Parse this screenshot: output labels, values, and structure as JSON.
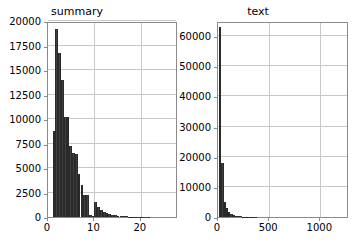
{
  "figure": {
    "background": "#ffffff",
    "bar_color": "#3f3f3f",
    "grid_color": "#c8c8c8",
    "axis_color": "#8a8a8a"
  },
  "chart_data": [
    {
      "type": "bar",
      "subplot": "left",
      "title": "summary",
      "xlabel": "",
      "ylabel": "",
      "xlim": [
        0,
        28
      ],
      "ylim": [
        0,
        20000
      ],
      "grid": true,
      "legend": null,
      "xticks": [
        0,
        10,
        20
      ],
      "xtick_labels": [
        "0",
        "10",
        "20"
      ],
      "yticks": [
        0,
        2500,
        5000,
        7500,
        10000,
        12500,
        15000,
        17500,
        20000
      ],
      "ytick_labels": [
        "0",
        "2500",
        "5000",
        "7500",
        "10000",
        "12500",
        "15000",
        "17500",
        "20000"
      ],
      "bin_edges": [
        1.0,
        1.6,
        2.2,
        2.8,
        3.4,
        4.0,
        4.6,
        5.2,
        5.8,
        6.4,
        7.0,
        7.6,
        8.2,
        8.8,
        9.4,
        10.0,
        10.6,
        11.2,
        11.8,
        12.4,
        13.0,
        13.6,
        14.2,
        14.8,
        15.4,
        16.0,
        16.6,
        17.2,
        17.8,
        18.4,
        19.0,
        20.0,
        22.0,
        24.0,
        26.0,
        28.0
      ],
      "values": [
        8800,
        19200,
        16700,
        14000,
        10200,
        10200,
        7200,
        6500,
        6400,
        4400,
        3300,
        2200,
        2200,
        250,
        150,
        1500,
        1050,
        700,
        500,
        380,
        300,
        230,
        180,
        140,
        110,
        80,
        60,
        45,
        30,
        20,
        12,
        8,
        4,
        2,
        1
      ]
    },
    {
      "type": "bar",
      "subplot": "right",
      "title": "text",
      "xlabel": "",
      "ylabel": "",
      "xlim": [
        0,
        1280
      ],
      "ylim": [
        0,
        65000
      ],
      "grid": true,
      "legend": null,
      "xticks": [
        0,
        500,
        1000
      ],
      "xtick_labels": [
        "0",
        "500",
        "1000"
      ],
      "yticks": [
        0,
        10000,
        20000,
        30000,
        40000,
        50000,
        60000
      ],
      "ytick_labels": [
        "0",
        "10000",
        "20000",
        "30000",
        "40000",
        "50000",
        "60000"
      ],
      "bin_edges": [
        10,
        32,
        54,
        76,
        98,
        120,
        142,
        164,
        186,
        208,
        230,
        252,
        274,
        296,
        318,
        340,
        380,
        440,
        520,
        640,
        800,
        1000,
        1280
      ],
      "values": [
        63000,
        18000,
        5000,
        3000,
        1800,
        900,
        600,
        420,
        300,
        220,
        160,
        120,
        90,
        70,
        50,
        35,
        22,
        14,
        9,
        5,
        3,
        1
      ]
    }
  ]
}
